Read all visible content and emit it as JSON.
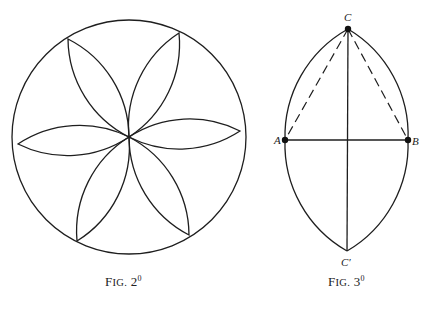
{
  "figures": [
    {
      "id": "fig2",
      "caption_prefix": "F",
      "caption_smallcaps": "IG.",
      "caption_number": "2",
      "caption_superscript": "0",
      "description": "Six-petal rosette inscribed in a circle",
      "circle": {
        "cx": 129,
        "cy": 137,
        "r": 117
      },
      "center": {
        "x": 129,
        "y": 137
      },
      "petal_tips": [
        {
          "x": 240,
          "y": 131
        },
        {
          "x": 179,
          "y": 33
        },
        {
          "x": 68,
          "y": 39
        },
        {
          "x": 18,
          "y": 144
        },
        {
          "x": 77,
          "y": 241
        },
        {
          "x": 189,
          "y": 235
        }
      ],
      "petal_arc_radius": 111
    },
    {
      "id": "fig3",
      "caption_prefix": "F",
      "caption_smallcaps": "IG.",
      "caption_number": "3",
      "caption_superscript": "0",
      "description": "Pointed-arch (vesica) construction with equilateral triangle",
      "points": {
        "C": {
          "label": "C",
          "x": 348,
          "y": 29
        },
        "A": {
          "label": "A",
          "x": 285,
          "y": 140
        },
        "B": {
          "label": "B",
          "x": 408,
          "y": 140
        },
        "C_prime": {
          "label": "C′",
          "x": 347,
          "y": 251
        }
      },
      "lines": [
        {
          "from": "A",
          "to": "B",
          "style": "solid"
        },
        {
          "from": "C",
          "to": "C_prime",
          "style": "solid"
        },
        {
          "from": "C",
          "to": "A",
          "style": "dashed"
        },
        {
          "from": "C",
          "to": "B",
          "style": "dashed"
        }
      ],
      "arcs": [
        {
          "from": "A",
          "to": "C",
          "radius": 123
        },
        {
          "from": "C",
          "to": "B",
          "radius": 123
        },
        {
          "from": "A",
          "to": "C_prime",
          "radius": 123
        },
        {
          "from": "C_prime",
          "to": "B",
          "radius": 123
        }
      ]
    }
  ]
}
